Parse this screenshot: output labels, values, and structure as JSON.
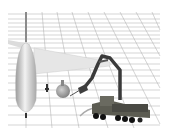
{
  "scene": {
    "description": "3D rendered scene of an airliner beside a multi-axle vehicle with an articulated robotic arm on a perspective grid floor",
    "objects": [
      {
        "name": "airplane",
        "color": "#d8d8d8"
      },
      {
        "name": "robotic-arm-vehicle",
        "color": "#4a4a44"
      },
      {
        "name": "grid-floor",
        "color": "#9a9a9a"
      }
    ],
    "background_color": "#ffffff"
  }
}
